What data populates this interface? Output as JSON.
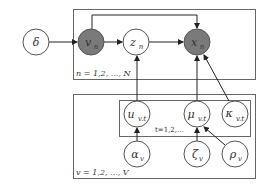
{
  "diagram": {
    "type": "plate-notation graphical model",
    "colors": {
      "observed_fill": "#7a7a7a",
      "latent_fill": "#ffffff",
      "stroke": "#555555",
      "plate_stroke": "#666666"
    },
    "plates": {
      "top": {
        "label": "n = 1,2, ..., N"
      },
      "bottom": {
        "label": "v = 1,2, ..., V"
      },
      "inner": {
        "label": "t=1,2,..."
      }
    },
    "nodes": {
      "delta": {
        "symbol": "δ",
        "observed": false
      },
      "v_n": {
        "symbol": "v",
        "sub": "n",
        "observed": true
      },
      "z_n": {
        "symbol": "z",
        "sub": "n",
        "observed": false
      },
      "x_n": {
        "symbol": "x",
        "sub": "n",
        "observed": true
      },
      "u_vt": {
        "symbol": "u",
        "sub": "v.t",
        "observed": false
      },
      "mu_vt": {
        "symbol": "μ",
        "sub": "v.t",
        "observed": false
      },
      "kappa_vt": {
        "symbol": "κ",
        "sub": "v.t",
        "observed": false
      },
      "alpha_v": {
        "symbol": "α",
        "sub": "v",
        "observed": false
      },
      "zeta_v": {
        "symbol": "ζ",
        "sub": "v",
        "observed": false
      },
      "rho_v": {
        "symbol": "ρ",
        "sub": "v",
        "observed": false
      }
    },
    "edges": [
      [
        "delta",
        "v_n"
      ],
      [
        "v_n",
        "z_n"
      ],
      [
        "v_n",
        "x_n"
      ],
      [
        "z_n",
        "x_n"
      ],
      [
        "u_vt",
        "z_n"
      ],
      [
        "mu_vt",
        "x_n"
      ],
      [
        "kappa_vt",
        "x_n"
      ],
      [
        "alpha_v",
        "u_vt"
      ],
      [
        "zeta_v",
        "mu_vt"
      ],
      [
        "rho_v",
        "mu_vt"
      ]
    ]
  }
}
